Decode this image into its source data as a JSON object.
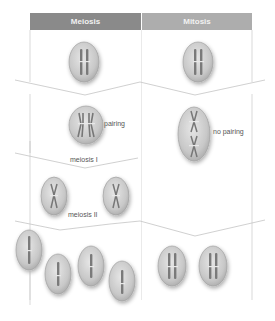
{
  "headers": {
    "meiosis": "Meiosis",
    "mitosis": "Mitosis"
  },
  "labels": {
    "pairing": "pairing",
    "no_pairing": "no pairing",
    "meiosis_1": "meiosis I",
    "meiosis_2": "meiosis II"
  },
  "colors": {
    "meiosis_header": "#8a8a8a",
    "mitosis_header": "#adadad",
    "cell_fill": "#c9c9c9",
    "chromosome": "#7a7a7a",
    "outline": "#bdbdbd"
  },
  "stages": [
    {
      "row": "parent",
      "meiosis_cells": 1,
      "mitosis_cells": 1
    },
    {
      "row": "prophase",
      "meiosis_cells": 1,
      "mitosis_cells": 1
    },
    {
      "row": "after_division_1",
      "meiosis_cells": 2,
      "mitosis_cells": 0
    },
    {
      "row": "final",
      "meiosis_cells": 4,
      "mitosis_cells": 2
    }
  ]
}
